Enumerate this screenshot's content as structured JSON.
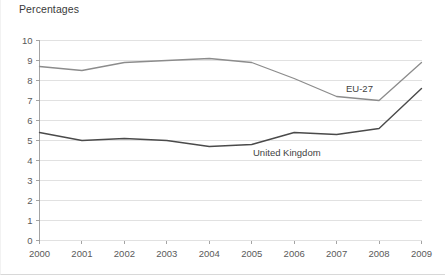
{
  "figure": {
    "title": "Percentages",
    "background_color": "#ffffff",
    "border_color": "#d8d8d8"
  },
  "axis_style": {
    "grid_color": "#d9d9d9",
    "axis_color": "#9a9a9a",
    "tick_text_color": "#5a5a5a"
  },
  "chart_data": {
    "type": "line",
    "title": "Percentages",
    "xlabel": "",
    "ylabel": "",
    "categories": [
      "2000",
      "2001",
      "2002",
      "2003",
      "2004",
      "2005",
      "2006",
      "2007",
      "2008",
      "2009"
    ],
    "x": [
      2000,
      2001,
      2002,
      2003,
      2004,
      2005,
      2006,
      2007,
      2008,
      2009
    ],
    "ylim": [
      0,
      10
    ],
    "yticks": [
      0,
      1,
      2,
      3,
      4,
      5,
      6,
      7,
      8,
      9,
      10
    ],
    "ytick_labels": [
      "0",
      "1",
      "2",
      "3",
      "4",
      "5",
      "6",
      "7",
      "8",
      "9",
      "10"
    ],
    "grid": "horizontal",
    "legend": "inline-annotations",
    "series": [
      {
        "name": "EU-27",
        "color": "#8c8c8c",
        "line_width": 1.3,
        "values": [
          8.7,
          8.5,
          8.9,
          9.0,
          9.1,
          8.9,
          8.1,
          7.2,
          7.0,
          8.9
        ],
        "annotation": {
          "text": "EU-27",
          "x": 345,
          "y": 92
        }
      },
      {
        "name": "United Kingdom",
        "color": "#4a4a4a",
        "line_width": 1.4,
        "values": [
          5.4,
          5.0,
          5.1,
          5.0,
          4.7,
          4.8,
          5.4,
          5.3,
          5.6,
          7.6
        ],
        "annotation": {
          "text": "United Kingdom",
          "x": 252,
          "y": 156
        }
      }
    ]
  }
}
